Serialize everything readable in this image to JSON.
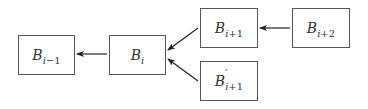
{
  "diagram": {
    "nodes": [
      {
        "id": "b_i_minus_1",
        "base": "B",
        "prime": "",
        "sub_var": "i",
        "sub_op": "−",
        "sub_num": "1"
      },
      {
        "id": "b_i",
        "base": "B",
        "prime": "",
        "sub_var": "i",
        "sub_op": "",
        "sub_num": ""
      },
      {
        "id": "b_i_plus_1",
        "base": "B",
        "prime": "",
        "sub_var": "i",
        "sub_op": "+",
        "sub_num": "1"
      },
      {
        "id": "b_prime_i_plus_1",
        "base": "B",
        "prime": "′",
        "sub_var": "i",
        "sub_op": "+",
        "sub_num": "1"
      },
      {
        "id": "b_i_plus_2",
        "base": "B",
        "prime": "",
        "sub_var": "i",
        "sub_op": "+",
        "sub_num": "2"
      }
    ],
    "edges": [
      {
        "from": "b_i",
        "to": "b_i_minus_1"
      },
      {
        "from": "b_i_plus_1",
        "to": "b_i"
      },
      {
        "from": "b_prime_i_plus_1",
        "to": "b_i"
      },
      {
        "from": "b_i_plus_2",
        "to": "b_i_plus_1"
      }
    ],
    "colors": {
      "stroke": "#555555",
      "arrow": "#222222",
      "text": "#333333"
    }
  }
}
